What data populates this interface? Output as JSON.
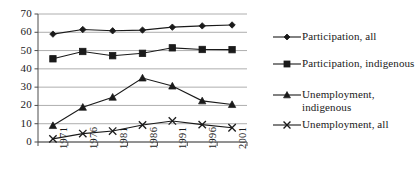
{
  "chart_data": {
    "type": "line",
    "title": "",
    "xlabel": "",
    "ylabel": "",
    "categories": [
      "1971",
      "1976",
      "1981",
      "1986",
      "1991",
      "1996",
      "2001"
    ],
    "ylim": [
      0,
      70
    ],
    "ytick_labels": [
      "0",
      "10",
      "20",
      "30",
      "40",
      "50",
      "60",
      "70"
    ],
    "ytick_values": [
      0,
      10,
      20,
      30,
      40,
      50,
      60,
      70
    ],
    "grid": true,
    "legend_position": "right",
    "series": [
      {
        "name": "Participation, all",
        "marker": "diamond",
        "color": "#1a1a1a",
        "values": [
          59,
          61.5,
          60.8,
          61.2,
          62.8,
          63.5,
          64
        ]
      },
      {
        "name": "Participation, indigenous",
        "marker": "square",
        "color": "#1a1a1a",
        "values": [
          45.5,
          49.5,
          47.2,
          48.5,
          51.5,
          50.6,
          50.5
        ]
      },
      {
        "name": "Unemployment,\nindigenous",
        "marker": "triangle",
        "color": "#1a1a1a",
        "values": [
          9,
          19,
          24.5,
          35,
          30.6,
          22.5,
          20.5
        ]
      },
      {
        "name": "Unemployment, all",
        "marker": "cross",
        "color": "#1a1a1a",
        "values": [
          1.7,
          4.6,
          6,
          9.3,
          11.5,
          9.5,
          7.8
        ]
      }
    ]
  },
  "legend": {
    "items": [
      {
        "label": "Participation, all"
      },
      {
        "label": "Participation, indigenous"
      },
      {
        "label": "Unemployment,\nindigenous"
      },
      {
        "label": "Unemployment, all"
      }
    ]
  },
  "axes": {
    "y_labels": [
      "70",
      "60",
      "50",
      "40",
      "30",
      "20",
      "10",
      "0"
    ],
    "x_labels": [
      "1971",
      "1976",
      "1981",
      "1986",
      "1991",
      "1996",
      "2001"
    ]
  },
  "colors": {
    "series": "#1a1a1a",
    "grid": "#999999",
    "axis": "#4d4d4d",
    "background": "#ffffff"
  }
}
